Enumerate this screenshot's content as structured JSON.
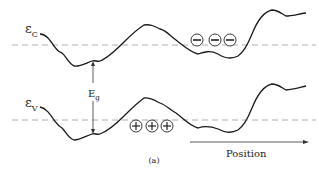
{
  "figure": {
    "caption": "(a)",
    "conduction_band": {
      "label_main": "ε",
      "label_sub": "C",
      "carrier_symbol": "−",
      "carrier_count": 3
    },
    "valence_band": {
      "label_main": "ε",
      "label_sub": "V",
      "carrier_symbol": "+",
      "carrier_count": 3
    },
    "band_gap": {
      "label_main": "E",
      "label_sub": "g"
    },
    "axis": {
      "label": "Position"
    },
    "colors": {
      "curve": "#1a1a1a",
      "dashed_line": "#9a9a9a",
      "arrow": "#333333"
    }
  }
}
